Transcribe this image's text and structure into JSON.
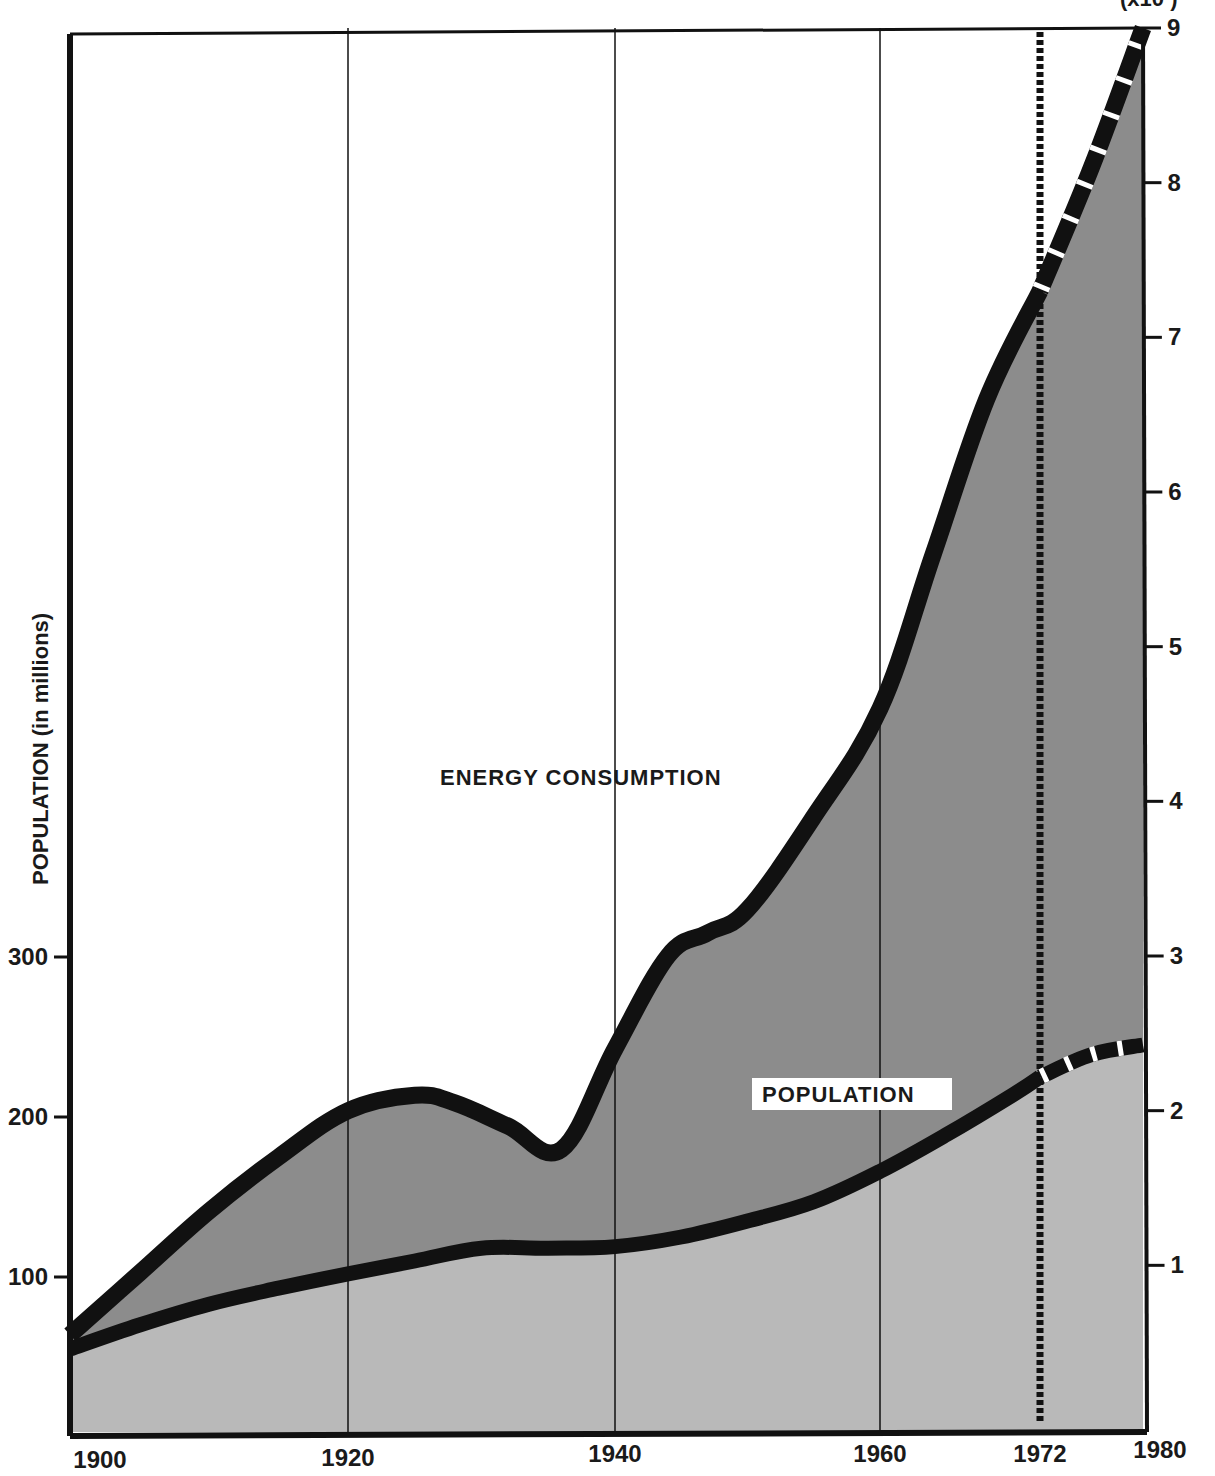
{
  "chart_data": {
    "type": "area",
    "title": "",
    "xlabel": "",
    "ylabel_left": "POPULATION (in millions)",
    "ylabel_right_partial": "(x10   )",
    "x_ticks": [
      1900,
      1920,
      1940,
      1960,
      1972,
      1980
    ],
    "x_tick_labels": [
      "1900",
      "1920",
      "1940",
      "1960",
      "1972",
      "1980"
    ],
    "xlim": [
      1900,
      1980
    ],
    "y_left": {
      "ticks": [
        100,
        200,
        300
      ],
      "tick_labels": [
        "100",
        "200",
        "300"
      ],
      "range": [
        0,
        350
      ]
    },
    "y_right": {
      "ticks": [
        1,
        2,
        3,
        4,
        5,
        6,
        7,
        8,
        9
      ],
      "tick_labels": [
        "1",
        "2",
        "3",
        "4",
        "5",
        "6",
        "7",
        "8",
        "9"
      ],
      "range": [
        0,
        9
      ]
    },
    "grid": {
      "vertical_lines_at": [
        1920,
        1940,
        1960
      ],
      "horizontal": false
    },
    "marker_line": {
      "x": 1972,
      "style": "dotted",
      "meaning": "boundary between historical data and projection"
    },
    "series": [
      {
        "name": "ENERGY CONSUMPTION",
        "axis": "right",
        "fill": "#8c8c8c",
        "x": [
          1900,
          1905,
          1910,
          1915,
          1920,
          1925,
          1928,
          1932,
          1936,
          1940,
          1944,
          1947,
          1950,
          1955,
          1960,
          1964,
          1968,
          1972
        ],
        "values": [
          0.55,
          0.95,
          1.35,
          1.7,
          2.0,
          2.1,
          2.05,
          1.9,
          1.75,
          2.4,
          3.0,
          3.15,
          3.3,
          3.9,
          4.6,
          5.6,
          6.6,
          7.3
        ],
        "projection": {
          "x": [
            1972,
            1976,
            1980
          ],
          "values": [
            7.3,
            8.1,
            9.0
          ],
          "style": "dashed"
        }
      },
      {
        "name": "POPULATION",
        "axis": "left",
        "fill": "#b9b9b9",
        "x": [
          1900,
          1905,
          1910,
          1915,
          1920,
          1925,
          1930,
          1935,
          1940,
          1945,
          1950,
          1955,
          1960,
          1965,
          1970,
          1972
        ],
        "values": [
          55,
          70,
          83,
          93,
          102,
          110,
          118,
          118,
          119,
          125,
          135,
          147,
          166,
          189,
          214,
          225
        ],
        "projection": {
          "x": [
            1972,
            1976,
            1980
          ],
          "values": [
            225,
            239,
            245
          ],
          "style": "dashed"
        }
      }
    ],
    "annotations": [
      {
        "text": "ENERGY CONSUMPTION",
        "x": 1946,
        "y_right": 4.1
      },
      {
        "text": "POPULATION",
        "x": 1968,
        "y_left": 225,
        "boxed": true
      }
    ]
  },
  "labels": {
    "energy": "ENERGY CONSUMPTION",
    "population": "POPULATION",
    "left_axis_title": "POPULATION (in millions)",
    "right_axis_units": "(x10   )"
  },
  "colors": {
    "energy_fill": "#8c8c8c",
    "population_fill": "#b9b9b9",
    "line": "#111111",
    "frame": "#111111",
    "background": "#ffffff"
  }
}
